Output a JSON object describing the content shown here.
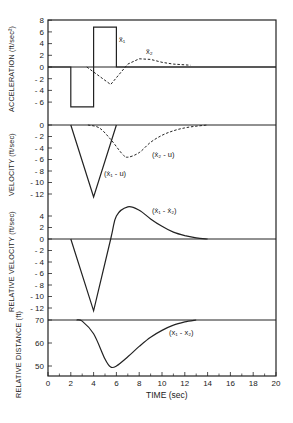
{
  "chart_data": {
    "type": "line",
    "layout": "4 vertically stacked panels sharing x-axis",
    "xlabel": "TIME  (sec)",
    "xlim": [
      0,
      20
    ],
    "x_ticks": [
      0,
      2,
      4,
      6,
      8,
      10,
      12,
      14,
      16,
      18,
      20
    ],
    "grid": false,
    "panels": [
      {
        "ylabel": "ACCELERATION (ft/sec²)",
        "ylim": [
          -8,
          8
        ],
        "y_ticks": [
          8,
          6,
          4,
          2,
          0,
          -2,
          -4,
          -6
        ],
        "series": [
          {
            "name": "ẍ₁",
            "style": "solid",
            "x": [
              0,
              2,
              2,
              4,
              4,
              6,
              6,
              20
            ],
            "y": [
              0,
              0,
              -6.8,
              -6.8,
              6.8,
              6.8,
              0,
              0
            ]
          },
          {
            "name": "ẍ₂",
            "style": "dashed",
            "x": [
              3.4,
              5.5,
              7,
              8,
              9,
              10,
              11,
              12.5
            ],
            "y": [
              0,
              -3,
              0.5,
              1.4,
              1.3,
              0.8,
              0.5,
              0.3
            ]
          }
        ]
      },
      {
        "ylabel": "VELOCITY  (ft/sec)",
        "ylim": [
          -14,
          0
        ],
        "y_ticks": [
          0,
          -2,
          -4,
          -6,
          -8,
          -10,
          -12
        ],
        "series": [
          {
            "name": "(ẋ₁ - u)",
            "style": "solid",
            "x": [
              2,
              4,
              6
            ],
            "y": [
              0,
              -12.5,
              0
            ]
          },
          {
            "name": "(ẋ₂ - u)",
            "style": "dashed",
            "x": [
              3.5,
              4.5,
              5.5,
              6.5,
              7,
              8,
              9,
              10,
              11,
              12,
              13,
              14
            ],
            "y": [
              0,
              -0.5,
              -2.5,
              -5,
              -5.6,
              -4.8,
              -3,
              -1.8,
              -1,
              -0.5,
              -0.2,
              0
            ]
          }
        ]
      },
      {
        "ylabel": "RELATIVE VELOCITY  (ft/sec)",
        "ylim": [
          -13,
          6
        ],
        "y_ticks": [
          4,
          2,
          0,
          -2,
          -4,
          -6,
          -8,
          -10,
          -12
        ],
        "series": [
          {
            "name": "(ẋ₁ - ẋ₂)",
            "style": "solid",
            "x": [
              2,
              4,
              5.5,
              6,
              7,
              8,
              9,
              10,
              11,
              12,
              13,
              14
            ],
            "y": [
              0,
              -12.5,
              0,
              4,
              5.6,
              5,
              3.5,
              2.2,
              1.2,
              0.6,
              0.2,
              0
            ]
          }
        ]
      },
      {
        "ylabel": "RELATIVE DISTANCE (ft)",
        "ylim": [
          45.6,
          70
        ],
        "y_ticks": [
          70,
          60,
          50
        ],
        "series": [
          {
            "name": "(x₁ - x₂)",
            "style": "solid",
            "x": [
              2.5,
              3,
              4,
              5,
              5.5,
              6,
              7,
              8,
              9,
              10,
              11,
              12,
              13
            ],
            "y": [
              70,
              69.5,
              64,
              53,
              49.5,
              50,
              54,
              58.5,
              62.5,
              65.5,
              67.8,
              69.2,
              70
            ]
          }
        ]
      }
    ]
  },
  "labels": {
    "xlabel": "TIME  (sec)",
    "y_accel": "ACCELERATION (ft/sec²)",
    "y_vel": "VELOCITY  (ft/sec)",
    "y_relvel": "RELATIVE VELOCITY  (ft/sec)",
    "y_reldist": "RELATIVE DISTANCE (ft)",
    "ann_x1dd": "ẍ₁",
    "ann_x2dd": "ẍ₂",
    "ann_v1": "(ẋ₁ - u)",
    "ann_v2": "(ẋ₂ - u)",
    "ann_rv": "(ẋ₁ - ẋ₂)",
    "ann_rd": "(x₁ - x₂)"
  }
}
